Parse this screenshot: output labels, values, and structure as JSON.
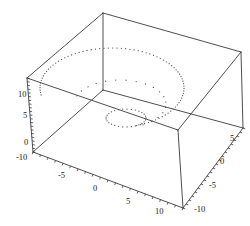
{
  "figure": {
    "background_color": "#ffffff",
    "line_color": "#3a3a3a",
    "point_color": "#4a4a4a",
    "label_color": "#222222",
    "width": 250,
    "height": 226
  },
  "chart_data": {
    "type": "scatter",
    "title": "",
    "subtitle": "",
    "projection": "3d",
    "xlabel": "",
    "ylabel": "",
    "zlabel": "",
    "grid": false,
    "legend": null,
    "box_frame": true,
    "xlim": [
      -10,
      10
    ],
    "ylim": [
      -10,
      10
    ],
    "zlim": [
      -10,
      10
    ],
    "axes": [
      {
        "name": "bottom-left-axis",
        "position": "front-left-bottom-edge",
        "ticks": [
          -10,
          -5,
          0,
          5,
          10
        ],
        "tick_labels": [
          "-10",
          "-5",
          "0",
          "5",
          "10"
        ]
      },
      {
        "name": "bottom-right-axis",
        "position": "front-right-bottom-edge",
        "ticks": [
          -10,
          -5,
          0,
          5
        ],
        "tick_labels": [
          "-10",
          "-5",
          "0",
          "5"
        ]
      },
      {
        "name": "left-vertical-axis",
        "position": "back-left-vertical-edge",
        "ticks": [
          0,
          5,
          10
        ],
        "tick_labels": [
          "0",
          "5",
          "10"
        ]
      }
    ],
    "tick_labels_rendered": [
      {
        "text": "10",
        "x": 18,
        "y": 97,
        "axis": "left-vertical-axis"
      },
      {
        "text": "5",
        "x": 23,
        "y": 118,
        "axis": "left-vertical-axis"
      },
      {
        "text": "0",
        "x": 24,
        "y": 145,
        "axis": "left-vertical-axis"
      },
      {
        "text": "-10",
        "x": 16,
        "y": 160,
        "axis": "bottom-left-axis"
      },
      {
        "text": "-5",
        "x": 58,
        "y": 178,
        "axis": "bottom-left-axis"
      },
      {
        "text": "0",
        "x": 93,
        "y": 191,
        "axis": "bottom-left-axis"
      },
      {
        "text": "5",
        "x": 126,
        "y": 204,
        "axis": "bottom-left-axis"
      },
      {
        "text": "10",
        "x": 155,
        "y": 214,
        "axis": "bottom-left-axis"
      },
      {
        "text": "-10",
        "x": 194,
        "y": 212,
        "axis": "bottom-right-axis"
      },
      {
        "text": "-5",
        "x": 209,
        "y": 188,
        "axis": "bottom-right-axis"
      },
      {
        "text": "0",
        "x": 220,
        "y": 164,
        "axis": "bottom-right-axis"
      },
      {
        "text": "5",
        "x": 230,
        "y": 141,
        "axis": "bottom-right-axis"
      }
    ],
    "series": [
      {
        "name": "spiral-outer",
        "style": "dotted",
        "description": "large dotted elliptical spiral arc in upper region",
        "center": [
          112,
          88
        ],
        "rx": 72,
        "ry": 40,
        "n_points": 76,
        "angle_start": 170,
        "angle_end": 430
      },
      {
        "name": "spiral-inner",
        "style": "dotted",
        "description": "small dotted ellipse near plot center",
        "center": [
          126,
          118
        ],
        "rx": 20,
        "ry": 9,
        "n_points": 30,
        "angle_start": 0,
        "angle_end": 360
      },
      {
        "name": "spiral-transition",
        "style": "dotted",
        "description": "sparse dotted points connecting outer arc to inner ellipse",
        "center": [
          120,
          104
        ],
        "rx": 46,
        "ry": 24,
        "n_points": 18,
        "angle_start": 200,
        "angle_end": 420
      }
    ]
  },
  "box": {
    "name": "bounding-box",
    "vertices": {
      "top_back": [
        103,
        13
      ],
      "top_left": [
        27,
        78
      ],
      "top_right": [
        241,
        52
      ],
      "top_front": [
        178,
        130
      ],
      "bottom_left": [
        33,
        152
      ],
      "bottom_right": [
        243,
        128
      ],
      "bottom_front": [
        183,
        208
      ]
    }
  }
}
